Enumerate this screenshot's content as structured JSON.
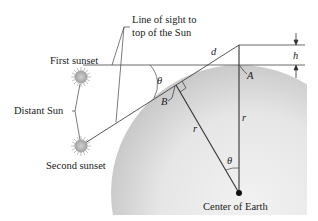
{
  "figure": {
    "labels": {
      "line_of_sight_1": "Line of sight to",
      "line_of_sight_2": "top of the Sun",
      "first_sunset": "First sunset",
      "distant_sun": "Distant Sun",
      "second_sunset": "Second sunset",
      "center_of_earth": "Center of Earth",
      "d": "d",
      "h": "h",
      "A": "A",
      "B": "B",
      "r_left": "r",
      "r_right": "r",
      "theta_top": "θ",
      "theta_center": "θ"
    },
    "colors": {
      "line": "#333333",
      "earth_light": "#ececec",
      "earth_dark": "#c9c9c9",
      "sun": "#b8b8b8",
      "background": "#ffffff"
    },
    "icons": {
      "sun_first": "sun-icon",
      "sun_second": "sun-icon",
      "center_point": "dot-icon"
    }
  }
}
